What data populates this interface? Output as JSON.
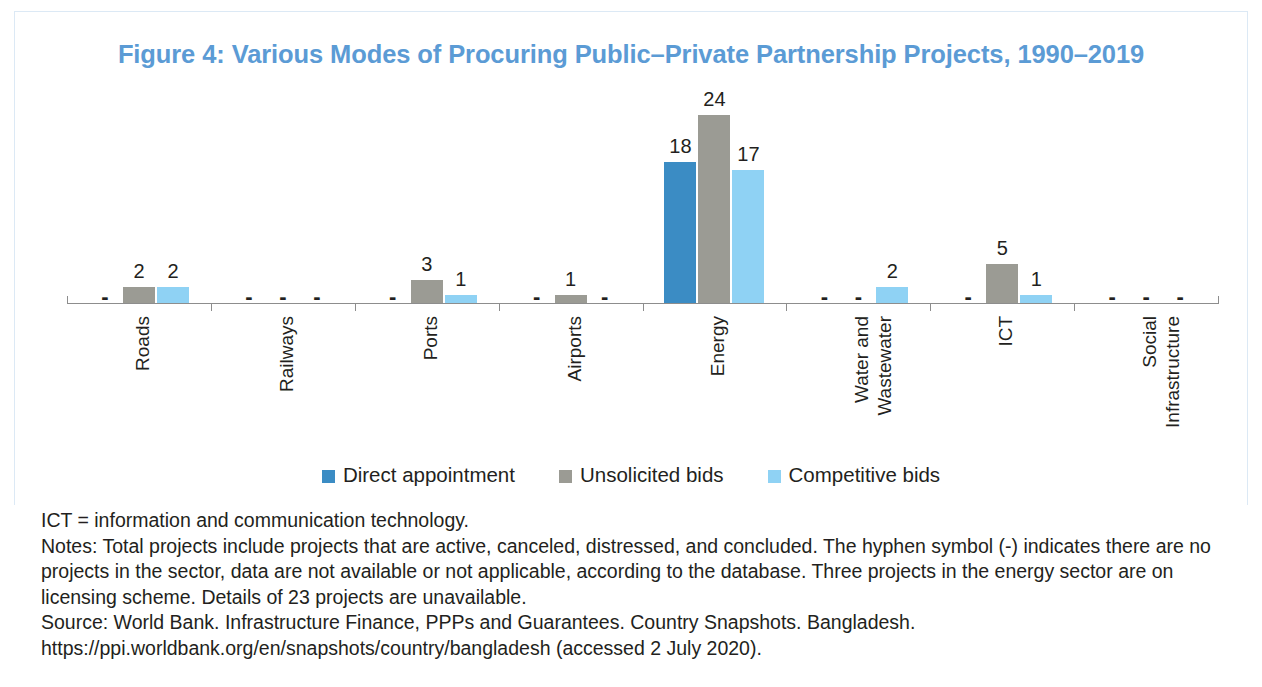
{
  "figure": {
    "title": "Figure 4: Various Modes of Procuring Public–Private Partnership Projects, 1990–2019",
    "title_color": "#5b9bd5",
    "frame_color": "#dce9f5"
  },
  "legend": {
    "position": "bottom-center",
    "items": [
      {
        "label": "Direct appointment",
        "color": "#3b8cc4"
      },
      {
        "label": "Unsolicited bids",
        "color": "#9b9b94"
      },
      {
        "label": "Competitive bids",
        "color": "#8fd2f4"
      }
    ]
  },
  "notes": {
    "abbreviation": "ICT = information and communication technology.",
    "note": "Notes: Total projects include projects that are active, canceled, distressed, and concluded. The hyphen symbol (-) indicates there are no projects in the sector, data are not available or not applicable, according to the database. Three projects in the energy sector are on licensing scheme. Details of 23 projects are unavailable.",
    "source": "Source: World Bank. Infrastructure Finance, PPPs and Guarantees. Country Snapshots. Bangladesh. https://ppi.worldbank.org/en/snapshots/country/bangladesh (accessed 2 July 2020)."
  },
  "chart_data": {
    "type": "bar",
    "title": "Figure 4: Various Modes of Procuring Public–Private Partnership Projects, 1990–2019",
    "xlabel": "",
    "ylabel": "",
    "ylim": [
      0,
      25
    ],
    "grid": false,
    "axis_visible": "x-only",
    "missing_marker": "-",
    "missing_meaning": "no projects in the sector, data not available or not applicable",
    "categories": [
      "Roads",
      "Railways",
      "Ports",
      "Airports",
      "Energy",
      "Water and Wastewater",
      "ICT",
      "Social Infrastructure"
    ],
    "category_lines": [
      [
        "Roads"
      ],
      [
        "Railways"
      ],
      [
        "Ports"
      ],
      [
        "Airports"
      ],
      [
        "Energy"
      ],
      [
        "Water and",
        "Wastewater"
      ],
      [
        "ICT"
      ],
      [
        "Social",
        "Infrastructure"
      ]
    ],
    "series": [
      {
        "name": "Direct appointment",
        "color": "#3b8cc4",
        "values": [
          null,
          null,
          null,
          null,
          18,
          null,
          null,
          null
        ],
        "labels": [
          "-",
          "-",
          "-",
          "-",
          "18",
          "-",
          "-",
          "-"
        ]
      },
      {
        "name": "Unsolicited bids",
        "color": "#9b9b94",
        "values": [
          2,
          null,
          3,
          1,
          24,
          null,
          5,
          null
        ],
        "labels": [
          "2",
          "-",
          "3",
          "1",
          "24",
          "-",
          "5",
          "-"
        ]
      },
      {
        "name": "Competitive bids",
        "color": "#8fd2f4",
        "values": [
          2,
          null,
          1,
          null,
          17,
          2,
          1,
          null
        ],
        "labels": [
          "2",
          "-",
          "1",
          "-",
          "17",
          "2",
          "1",
          "-"
        ]
      }
    ]
  }
}
